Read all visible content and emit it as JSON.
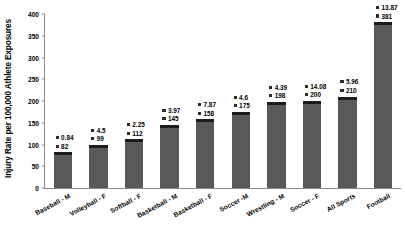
{
  "chart_data": {
    "type": "bar",
    "title": "",
    "xlabel": "",
    "ylabel": "Injury Rate per 100,000 Athlete Exposures",
    "ylim": [
      0,
      400
    ],
    "ytick_interval": 50,
    "yticks": [
      "0",
      "50",
      "100",
      "150",
      "200",
      "250",
      "300",
      "350",
      "400"
    ],
    "grid": false,
    "legend": "none",
    "categories": [
      "Baseball - M",
      "Volleyball - F",
      "Softball - F",
      "Basketball - M",
      "Basketball - F",
      "Soccer -M",
      "Wrestling - M",
      "Soccer - F",
      "All Sports",
      "Football"
    ],
    "series": [
      {
        "name": "Injury Rate per 100,000 Athlete Exposures",
        "values": [
          82,
          99,
          112,
          145,
          158,
          175,
          198,
          200,
          210,
          381
        ]
      },
      {
        "name": "Upper data label",
        "values": [
          0.84,
          4.5,
          2.25,
          3.97,
          7.87,
          4.6,
          4.39,
          14.08,
          5.96,
          13.87
        ]
      }
    ],
    "point_labels": [
      {
        "category": "Baseball - M",
        "top": "0.84",
        "bottom": "82"
      },
      {
        "category": "Volleyball - F",
        "top": "4.5",
        "bottom": "99"
      },
      {
        "category": "Softball - F",
        "top": "2.25",
        "bottom": "112"
      },
      {
        "category": "Basketball - M",
        "top": "3.97",
        "bottom": "145"
      },
      {
        "category": "Basketball - F",
        "top": "7.87",
        "bottom": "158"
      },
      {
        "category": "Soccer -M",
        "top": "4.6",
        "bottom": "175"
      },
      {
        "category": "Wrestling - M",
        "top": "4.39",
        "bottom": "198"
      },
      {
        "category": "Soccer - F",
        "top": "14.08",
        "bottom": "200"
      },
      {
        "category": "All Sports",
        "top": "5.96",
        "bottom": "210"
      },
      {
        "category": "Football",
        "top": "13.87",
        "bottom": "381"
      }
    ],
    "colors": {
      "bar_fill": "#595959",
      "bar_top_band": "#1c1c1c",
      "axis": "#8a8a8a",
      "text": "#000000",
      "background": "#ffffff"
    }
  }
}
